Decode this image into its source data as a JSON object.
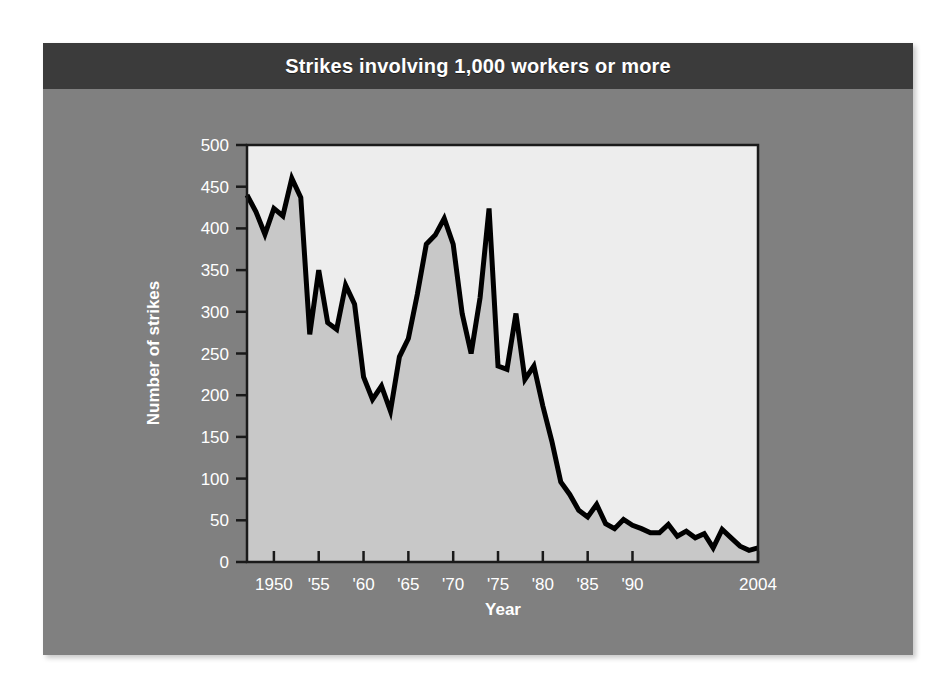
{
  "chart_data": {
    "type": "area",
    "title": "Strikes involving 1,000 workers or more",
    "xlabel": "Year",
    "ylabel": "Number of strikes",
    "xlim": [
      1947,
      2004
    ],
    "ylim": [
      0,
      500
    ],
    "ytick_values": [
      0,
      50,
      100,
      150,
      200,
      250,
      300,
      350,
      400,
      450,
      500
    ],
    "ytick_labels": [
      "0",
      "50",
      "100",
      "150",
      "200",
      "250",
      "300",
      "350",
      "400",
      "450",
      "500"
    ],
    "xtick_values": [
      1950,
      1955,
      1960,
      1965,
      1970,
      1975,
      1980,
      1985,
      1990,
      2004
    ],
    "xtick_labels": [
      "1950",
      "'55",
      "'60",
      "'65",
      "'70",
      "'75",
      "'80",
      "'85",
      "'90",
      "2004"
    ],
    "grid": false,
    "legend": false,
    "line_color": "#000000",
    "fill_color": "#c8c8c8",
    "plot_background": "#ededed",
    "series": [
      {
        "name": "Strikes involving 1,000 workers or more",
        "x": [
          1947,
          1948,
          1949,
          1950,
          1951,
          1952,
          1953,
          1954,
          1955,
          1956,
          1957,
          1958,
          1959,
          1960,
          1961,
          1962,
          1963,
          1964,
          1965,
          1966,
          1967,
          1968,
          1969,
          1970,
          1971,
          1972,
          1973,
          1974,
          1975,
          1976,
          1977,
          1978,
          1979,
          1980,
          1981,
          1982,
          1983,
          1984,
          1985,
          1986,
          1987,
          1988,
          1989,
          1990,
          1991,
          1992,
          1993,
          1994,
          1995,
          1996,
          1997,
          1998,
          1999,
          2000,
          2001,
          2002,
          2003,
          2004
        ],
        "values": [
          440,
          420,
          393,
          424,
          415,
          460,
          437,
          273,
          350,
          287,
          279,
          332,
          309,
          222,
          195,
          211,
          181,
          246,
          268,
          321,
          381,
          392,
          412,
          381,
          298,
          250,
          317,
          424,
          235,
          231,
          298,
          219,
          235,
          187,
          145,
          96,
          81,
          62,
          54,
          69,
          46,
          40,
          51,
          44,
          40,
          35,
          35,
          45,
          31,
          37,
          29,
          34,
          17,
          39,
          29,
          19,
          14,
          17
        ]
      }
    ],
    "annotations": []
  },
  "figure": {
    "page_background": "#ffffff",
    "card_background": "#808080",
    "title_bar_background": "#3b3b3b",
    "title_color": "#ffffff"
  }
}
